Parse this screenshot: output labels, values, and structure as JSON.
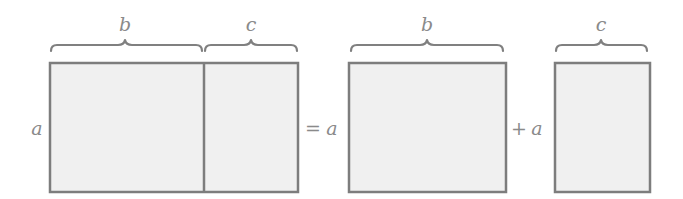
{
  "diagram": {
    "title": "",
    "colors": {
      "fill": "#f0f0f0",
      "stroke": "#7d7d7d",
      "text": "#8a8a8a"
    },
    "left_group": {
      "side_label": "a",
      "top_labels": {
        "b": "b",
        "c": "c"
      }
    },
    "equals": {
      "operator": "=",
      "label": "a"
    },
    "middle_group": {
      "top_label": "b"
    },
    "plus": {
      "operator": "+",
      "label": "a"
    },
    "right_group": {
      "top_label": "c"
    }
  }
}
